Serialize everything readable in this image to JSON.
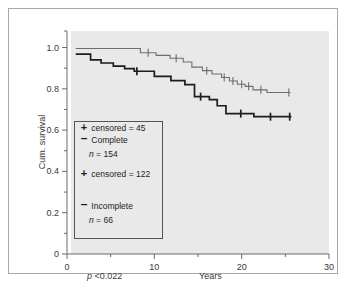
{
  "chart_data": {
    "type": "line",
    "title": "",
    "xlabel": "Years",
    "ylabel": "Cum. survival",
    "xlim": [
      0,
      30
    ],
    "ylim": [
      0,
      1.08
    ],
    "xticks": [
      0,
      10,
      20,
      30
    ],
    "xtick_labels": [
      "0",
      "10",
      "20",
      "30"
    ],
    "xminor_ticks": [
      5,
      15,
      25
    ],
    "yticks": [
      0,
      0.2,
      0.4,
      0.6,
      0.8,
      1.0
    ],
    "ytick_labels": [
      "0",
      "0.2",
      "0.4",
      "0.6",
      "0.8",
      "1.0"
    ],
    "yminor_ticks": [
      0.1,
      0.3,
      0.5,
      0.7,
      0.9,
      1.08
    ],
    "grid": false,
    "legend_position": "lower-left-inside",
    "annotations": [
      {
        "name": "p-value",
        "text_italic": "p",
        "text": " <0.022"
      }
    ],
    "series": [
      {
        "name": "Complete",
        "n": 154,
        "censored": 122,
        "color": "#6e6e6e",
        "line_width": 1.1,
        "step": "post",
        "points": [
          [
            1.0,
            0.995
          ],
          [
            8.2,
            0.995
          ],
          [
            8.4,
            0.975
          ],
          [
            9.8,
            0.975
          ],
          [
            10.2,
            0.962
          ],
          [
            11.4,
            0.962
          ],
          [
            11.8,
            0.948
          ],
          [
            13.0,
            0.948
          ],
          [
            13.3,
            0.93
          ],
          [
            14.0,
            0.93
          ],
          [
            14.3,
            0.905
          ],
          [
            15.2,
            0.905
          ],
          [
            15.5,
            0.888
          ],
          [
            16.3,
            0.888
          ],
          [
            16.6,
            0.872
          ],
          [
            17.4,
            0.872
          ],
          [
            17.7,
            0.855
          ],
          [
            18.3,
            0.855
          ],
          [
            18.6,
            0.838
          ],
          [
            19.2,
            0.838
          ],
          [
            19.5,
            0.822
          ],
          [
            20.1,
            0.822
          ],
          [
            20.4,
            0.812
          ],
          [
            21.0,
            0.812
          ],
          [
            21.3,
            0.795
          ],
          [
            22.6,
            0.795
          ],
          [
            22.9,
            0.782
          ],
          [
            25.6,
            0.782
          ]
        ],
        "censored_marks": [
          [
            9.3,
            0.975
          ],
          [
            12.5,
            0.948
          ],
          [
            16.0,
            0.888
          ],
          [
            18.0,
            0.855
          ],
          [
            19.0,
            0.838
          ],
          [
            20.0,
            0.822
          ],
          [
            20.8,
            0.812
          ],
          [
            22.2,
            0.795
          ],
          [
            25.4,
            0.782
          ]
        ]
      },
      {
        "name": "Incomplete",
        "n": 66,
        "censored": 45,
        "color": "#1d1d1d",
        "line_width": 1.7,
        "step": "post",
        "points": [
          [
            1.0,
            0.968
          ],
          [
            2.4,
            0.968
          ],
          [
            2.7,
            0.94
          ],
          [
            3.6,
            0.94
          ],
          [
            3.9,
            0.925
          ],
          [
            5.0,
            0.925
          ],
          [
            5.3,
            0.91
          ],
          [
            6.3,
            0.91
          ],
          [
            6.6,
            0.898
          ],
          [
            7.4,
            0.898
          ],
          [
            7.7,
            0.885
          ],
          [
            9.7,
            0.885
          ],
          [
            10.0,
            0.86
          ],
          [
            11.6,
            0.86
          ],
          [
            11.9,
            0.84
          ],
          [
            13.2,
            0.84
          ],
          [
            13.5,
            0.82
          ],
          [
            14.3,
            0.82
          ],
          [
            14.6,
            0.762
          ],
          [
            16.0,
            0.762
          ],
          [
            16.3,
            0.748
          ],
          [
            16.9,
            0.748
          ],
          [
            17.2,
            0.718
          ],
          [
            17.9,
            0.718
          ],
          [
            18.2,
            0.68
          ],
          [
            21.1,
            0.68
          ],
          [
            21.4,
            0.665
          ],
          [
            25.7,
            0.665
          ]
        ],
        "censored_marks": [
          [
            8.0,
            0.885
          ],
          [
            15.3,
            0.762
          ],
          [
            19.9,
            0.68
          ],
          [
            23.3,
            0.665
          ],
          [
            25.5,
            0.665
          ]
        ]
      }
    ]
  },
  "legend": {
    "entries": [
      {
        "marker": "–",
        "label": "Complete",
        "n_italic": "n",
        "n_text": " = 154",
        "censored_marker": "+",
        "censored_text": "censored = 122"
      },
      {
        "marker": "–",
        "label": "Incomplete",
        "n_italic": "n",
        "n_text": " = 66",
        "censored_marker": "+",
        "censored_text": "censored = 45"
      }
    ]
  },
  "axes": {
    "y_title": "Cum. survival",
    "x_title": "Years"
  }
}
